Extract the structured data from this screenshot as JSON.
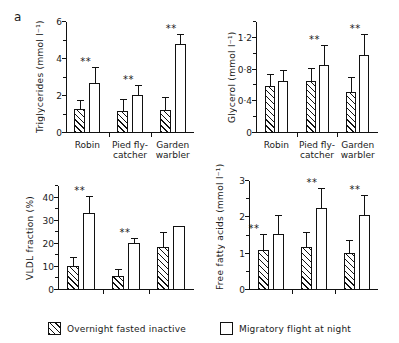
{
  "figure": {
    "panel_letter": "a"
  },
  "legend": {
    "items": [
      {
        "key": "fasted",
        "label": "Overnight fasted inactive",
        "style": "hatched"
      },
      {
        "key": "flight",
        "label": "Migratory flight at night",
        "style": "open"
      }
    ]
  },
  "chart_data": [
    {
      "id": "triglycerides",
      "type": "bar",
      "title": "",
      "xlabel": "",
      "ylabel": "Triglycerides (mmol l⁻¹)",
      "ylim": [
        0,
        6
      ],
      "yticks": [
        0,
        2,
        4,
        6
      ],
      "ytick_labels": [
        "0",
        "2",
        "4",
        "6"
      ],
      "yminor_step": 1,
      "grid": false,
      "show_xticklabels": true,
      "categories": [
        "Robin",
        "Pied fly-\ncatcher",
        "Garden\nwarbler"
      ],
      "series": [
        {
          "name": "Overnight fasted inactive",
          "style": "hatched",
          "values": [
            1.28,
            1.18,
            1.25
          ],
          "errors": [
            0.45,
            0.62,
            0.62
          ],
          "significance": [
            "",
            "",
            ""
          ]
        },
        {
          "name": "Migratory flight at night",
          "style": "open",
          "values": [
            2.72,
            2.05,
            4.8
          ],
          "errors": [
            0.78,
            0.5,
            0.5
          ],
          "significance": [
            "**",
            "**",
            "**"
          ]
        }
      ]
    },
    {
      "id": "glycerol",
      "type": "bar",
      "title": "",
      "xlabel": "",
      "ylabel": "Glycerol (mmol l⁻¹)",
      "ylim": [
        0,
        1.4
      ],
      "yticks": [
        0,
        0.4,
        0.8,
        1.2
      ],
      "ytick_labels": [
        "0",
        "0·4",
        "0·8",
        "1·2"
      ],
      "yminor_step": 0.2,
      "grid": false,
      "show_xticklabels": true,
      "categories": [
        "Robin",
        "Pied fly-\ncatcher",
        "Garden\nwarbler"
      ],
      "series": [
        {
          "name": "Overnight fasted inactive",
          "style": "hatched",
          "values": [
            0.59,
            0.65,
            0.52
          ],
          "errors": [
            0.14,
            0.16,
            0.18
          ],
          "significance": [
            "",
            "",
            ""
          ]
        },
        {
          "name": "Migratory flight at night",
          "style": "open",
          "values": [
            0.65,
            0.86,
            0.99
          ],
          "errors": [
            0.13,
            0.24,
            0.25
          ],
          "significance": [
            "",
            "**",
            "**"
          ]
        }
      ]
    },
    {
      "id": "vldl_fraction",
      "type": "bar",
      "title": "",
      "xlabel": "",
      "ylabel": "VLDL fraction (%)",
      "ylim": [
        0,
        45
      ],
      "yticks": [
        0,
        10,
        20,
        30,
        40
      ],
      "ytick_labels": [
        "0",
        "10",
        "20",
        "30",
        "40"
      ],
      "yminor_step": 5,
      "grid": false,
      "show_xticklabels": false,
      "categories": [
        "Robin",
        "Pied fly-\ncatcher",
        "Garden\nwarbler"
      ],
      "series": [
        {
          "name": "Overnight fasted inactive",
          "style": "hatched",
          "values": [
            10.5,
            6.0,
            18.5
          ],
          "errors": [
            3.5,
            2.8,
            6.0
          ],
          "significance": [
            "",
            "",
            ""
          ]
        },
        {
          "name": "Migratory flight at night",
          "style": "open",
          "values": [
            33.2,
            20.4,
            27.7
          ],
          "errors": [
            7.0,
            1.6,
            0.0
          ],
          "significance": [
            "**",
            "**",
            ""
          ]
        }
      ]
    },
    {
      "id": "free_fatty_acids",
      "type": "bar",
      "title": "",
      "xlabel": "",
      "ylabel": "Free fatty acids (mmol l⁻¹)",
      "ylim": [
        0,
        3
      ],
      "yticks": [
        0,
        1,
        2,
        3
      ],
      "ytick_labels": [
        "0",
        "1",
        "2",
        "3"
      ],
      "yminor_step": 0.5,
      "grid": false,
      "show_xticklabels": false,
      "categories": [
        "Robin",
        "Pied fly-\ncatcher",
        "Garden\nwarbler"
      ],
      "series": [
        {
          "name": "Overnight fasted inactive",
          "style": "hatched",
          "values": [
            1.09,
            1.19,
            1.02
          ],
          "errors": [
            0.42,
            0.38,
            0.32
          ],
          "significance": [
            "**",
            "",
            ""
          ]
        },
        {
          "name": "Migratory flight at night",
          "style": "open",
          "values": [
            1.55,
            2.27,
            2.07
          ],
          "errors": [
            0.5,
            0.52,
            0.53
          ],
          "significance": [
            "",
            "**",
            "**"
          ]
        }
      ]
    }
  ]
}
